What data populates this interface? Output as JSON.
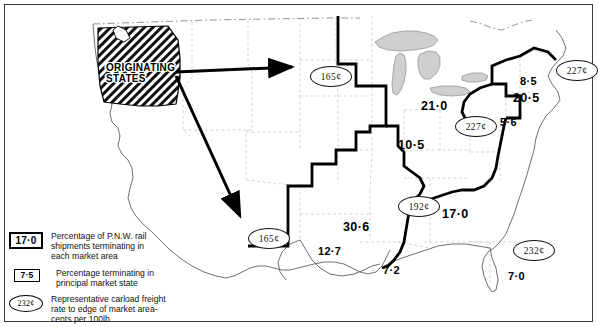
{
  "figure": {
    "originating_label_line1": "ORIGINATING",
    "originating_label_line2": "STATES"
  },
  "legend": {
    "items": [
      {
        "key": "17·0",
        "key_style": "thick-box",
        "lines": [
          "Percentage of P.N.W. rail",
          "shipments terminating in",
          "each market area"
        ]
      },
      {
        "key": "7·5",
        "key_style": "thin-box",
        "lines": [
          "Percentage terminating in",
          "principal market state"
        ]
      },
      {
        "key": "232¢",
        "key_style": "oval",
        "lines": [
          "Representative carload freight",
          "rate to edge of market area-",
          "cents per 100lb."
        ]
      }
    ]
  },
  "map_data": {
    "type": "choropleth-flow-map",
    "market_area_percentages": [
      {
        "label": "21·0",
        "size": "big",
        "x": 421,
        "y": 100,
        "note": "Upper Midwest market area"
      },
      {
        "label": "10·5",
        "size": "big",
        "x": 398,
        "y": 139,
        "note": "Central Midwest market area"
      },
      {
        "label": "30·6",
        "size": "big",
        "x": 343,
        "y": 221,
        "note": "South Central market area"
      },
      {
        "label": "17·0",
        "size": "big",
        "x": 442,
        "y": 208,
        "note": "Southeast market area"
      },
      {
        "label": "20·5",
        "size": "big",
        "x": 513,
        "y": 92,
        "note": "Northeast market area"
      }
    ],
    "principal_state_percentages": [
      {
        "label": "5·6",
        "size": "mid",
        "x": 500,
        "y": 117,
        "note": "principal state in NE area"
      },
      {
        "label": "8·5",
        "size": "mid",
        "x": 520,
        "y": 76,
        "note": "principal state upper NE"
      },
      {
        "label": "12·7",
        "size": "mid",
        "x": 318,
        "y": 246,
        "note": "principal state south central"
      },
      {
        "label": "7·2",
        "size": "mid",
        "x": 383,
        "y": 265,
        "note": "principal state gulf"
      },
      {
        "label": "7·0",
        "size": "mid",
        "x": 508,
        "y": 271,
        "note": "principal state southeast"
      }
    ],
    "freight_rates": [
      {
        "label": "165¢",
        "x": 310,
        "y": 66,
        "note": "rate to north-central market edge"
      },
      {
        "label": "165¢",
        "x": 248,
        "y": 228,
        "note": "rate to south-west market edge"
      },
      {
        "label": "227¢",
        "x": 455,
        "y": 116,
        "note": "rate to eastern market edge"
      },
      {
        "label": "227¢",
        "x": 562,
        "y": 64,
        "note": "rate to north-east market edge"
      },
      {
        "label": "192¢",
        "x": 398,
        "y": 200,
        "note": "rate to mid-south market edge"
      },
      {
        "label": "232¢",
        "x": 519,
        "y": 246,
        "note": "rate to south-east market edge"
      }
    ],
    "flow_arrows": [
      {
        "from": "originating-states",
        "to": "165¢ north-central",
        "direction": "east"
      },
      {
        "from": "originating-states",
        "to": "165¢ south-west",
        "direction": "south-east"
      }
    ]
  }
}
